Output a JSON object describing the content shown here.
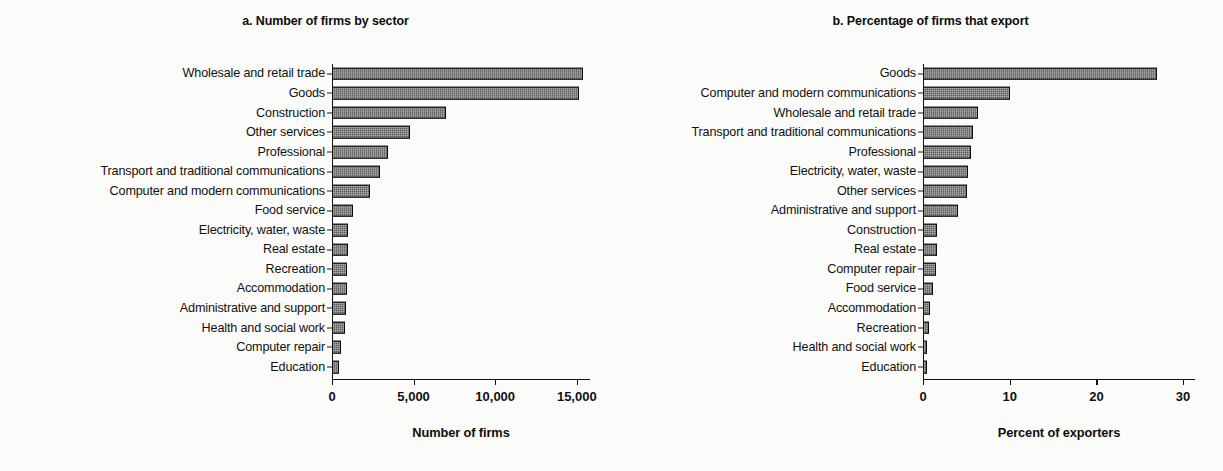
{
  "figure": {
    "background_color": "#fbfbf9",
    "bar_fill_color": "#585858",
    "bar_edge_color": "#0a0a0a"
  },
  "chart_data": [
    {
      "type": "bar",
      "orientation": "horizontal",
      "panel": "a",
      "title": "a. Number of firms by sector",
      "xlabel": "Number of firms",
      "ylabel": "",
      "xlim": [
        0,
        16000
      ],
      "xticks": [
        0,
        5000,
        10000,
        15000
      ],
      "xticklabels": [
        "0",
        "5,000",
        "10,000",
        "15,000"
      ],
      "grid": false,
      "legend": false,
      "categories": [
        "Wholesale and retail trade",
        "Goods",
        "Construction",
        "Other services",
        "Professional",
        "Transport and traditional communications",
        "Computer and modern communications",
        "Food service",
        "Electricity, water, waste",
        "Real estate",
        "Recreation",
        "Accommodation",
        "Administrative and support",
        "Health and social work",
        "Computer repair",
        "Education"
      ],
      "values": [
        15400,
        15150,
        7000,
        4750,
        3450,
        2950,
        2300,
        1300,
        950,
        950,
        900,
        900,
        850,
        800,
        550,
        450
      ]
    },
    {
      "type": "bar",
      "orientation": "horizontal",
      "panel": "b",
      "title": "b. Percentage of firms that export",
      "xlabel": "Percent of exporters",
      "ylabel": "",
      "xlim": [
        0,
        31.5
      ],
      "xticks": [
        0,
        10,
        20,
        30
      ],
      "xticklabels": [
        "0",
        "10",
        "20",
        "30"
      ],
      "grid": false,
      "legend": false,
      "categories": [
        "Goods",
        "Computer and modern communications",
        "Wholesale and retail trade",
        "Transport and traditional communications",
        "Professional",
        "Electricity, water, waste",
        "Other services",
        "Administrative and support",
        "Construction",
        "Real estate",
        "Computer repair",
        "Food service",
        "Accommodation",
        "Recreation",
        "Health and social work",
        "Education"
      ],
      "values": [
        27.0,
        10.0,
        6.3,
        5.8,
        5.5,
        5.2,
        5.1,
        4.0,
        1.6,
        1.6,
        1.5,
        1.2,
        0.8,
        0.7,
        0.5,
        0.3
      ]
    }
  ]
}
